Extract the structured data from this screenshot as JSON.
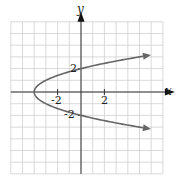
{
  "chart_data": {
    "type": "line",
    "title": "",
    "xlabel": "x",
    "ylabel": "y",
    "equation": "x = y^2 - 4",
    "xlim": [
      -6,
      7
    ],
    "ylim": [
      -7,
      6
    ],
    "grid": true,
    "x_tick_labels": [
      "-2",
      "2"
    ],
    "y_tick_labels": [
      "2",
      "-2"
    ],
    "series": [
      {
        "name": "parabola",
        "color": "#666666",
        "points": [
          {
            "x": 5.3,
            "y": 3.05
          },
          {
            "x": 0,
            "y": 2
          },
          {
            "x": -4,
            "y": 0
          },
          {
            "x": 0,
            "y": -2
          },
          {
            "x": 5.3,
            "y": -3.05
          }
        ],
        "arrows_at_ends": true
      }
    ]
  },
  "labels": {
    "x_axis": "x",
    "y_axis": "y",
    "tick_neg2_x": "-2",
    "tick_2_x": "2",
    "tick_2_y": "2",
    "tick_neg2_y": "-2"
  }
}
